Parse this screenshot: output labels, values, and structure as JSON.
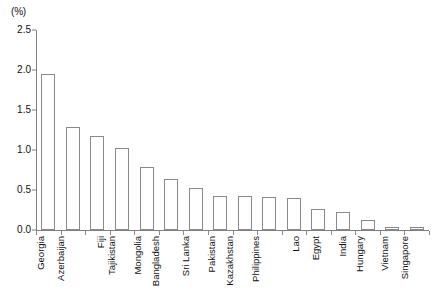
{
  "chart_data": {
    "type": "bar",
    "title": "",
    "subtitle": "",
    "xlabel": "",
    "ylabel": "",
    "unit_label": "(%)",
    "ylim": [
      0,
      2.5
    ],
    "ytick_values": [
      0.0,
      0.5,
      1.0,
      1.5,
      2.0,
      2.5
    ],
    "ytick_labels": [
      "0.0",
      "0.5",
      "1.0",
      "1.5",
      "2.0",
      "2.5"
    ],
    "grid": false,
    "legend": null,
    "bar_fill_color": "#ffffff",
    "bar_edge_color": "#8a8a8a",
    "axis_color": "#808080",
    "categories": [
      "Georgia",
      "Azerbaijan",
      "Fiji",
      "Tajikistan",
      "Mongolia",
      "Bangladesh",
      "Sri Lanka",
      "Pakistan",
      "Kazakhstan",
      "Philippines",
      "Lao",
      "Egypt",
      "India",
      "Hungary",
      "Vietnam",
      "Singapore"
    ],
    "values": [
      1.95,
      1.29,
      1.17,
      1.02,
      0.79,
      0.64,
      0.52,
      0.42,
      0.42,
      0.41,
      0.4,
      0.26,
      0.22,
      0.13,
      0.04,
      0.04
    ]
  }
}
